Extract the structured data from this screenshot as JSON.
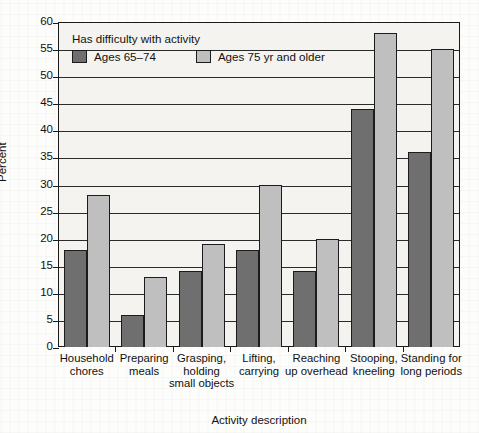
{
  "chart_data": {
    "type": "bar",
    "title": "",
    "xlabel": "Activity description",
    "ylabel": "Percent",
    "ylim": [
      0,
      60
    ],
    "ytick_step": 5,
    "yticks": [
      0,
      5,
      10,
      15,
      20,
      25,
      30,
      35,
      40,
      45,
      50,
      55,
      60
    ],
    "grid": true,
    "legend_position": "inside-top-left",
    "legend_title": "Has difficulty with activity",
    "categories": [
      "Household chores",
      "Preparing meals",
      "Grasping, holding small objects",
      "Lifting, carrying",
      "Reaching up overhead",
      "Stooping, kneeling",
      "Standing for long periods"
    ],
    "category_label_lines": [
      [
        "Household",
        "chores"
      ],
      [
        "Preparing",
        "meals"
      ],
      [
        "Grasping,",
        "holding",
        "small objects"
      ],
      [
        "Lifting,",
        "carrying"
      ],
      [
        "Reaching",
        "up overhead"
      ],
      [
        "Stooping,",
        "kneeling"
      ],
      [
        "Standing for",
        "long periods"
      ]
    ],
    "series": [
      {
        "name": "Ages 65–74",
        "color": "#6f6f6f",
        "values": [
          18,
          6,
          14,
          18,
          14,
          44,
          36
        ]
      },
      {
        "name": "Ages 75 yr and older",
        "color": "#bfbfbf",
        "values": [
          28,
          13,
          19,
          30,
          20,
          58,
          55
        ]
      }
    ]
  },
  "colors": {
    "series_0": "#6f6f6f",
    "series_1": "#bfbfbf",
    "axis": "#1a1a1a",
    "plot_background": "#f4f3ef",
    "page_background": "#fdfdfb"
  }
}
